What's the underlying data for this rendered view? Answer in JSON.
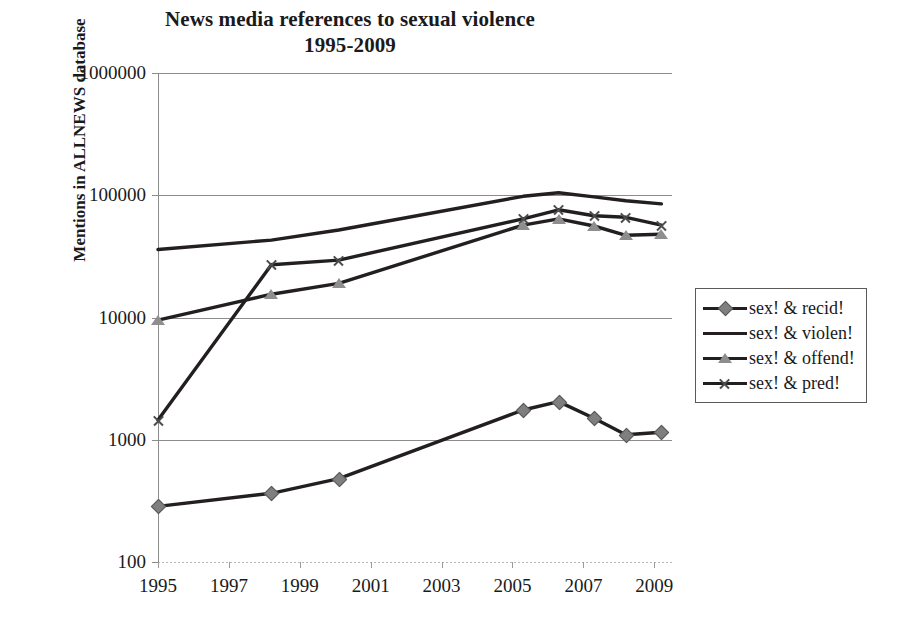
{
  "chart_data": {
    "type": "line",
    "title": "News media references to sexual violence\n1995-2009",
    "title_line1": "News media references to sexual violence",
    "title_line2": "1995-2009",
    "xlabel": "",
    "ylabel": "Mentions in ALLNEWS database",
    "yscale": "log",
    "ylim": [
      100,
      1000000
    ],
    "ytick_labels": [
      "1000000",
      "100000",
      "10000",
      "1000",
      "100"
    ],
    "ytick_values": [
      1000000,
      100000,
      10000,
      1000,
      100
    ],
    "xlim": [
      1995,
      2009.5
    ],
    "xtick_labels": [
      "1995",
      "1997",
      "1999",
      "2001",
      "2003",
      "2005",
      "2007",
      "2009"
    ],
    "xtick_values": [
      1995,
      1997,
      1999,
      2001,
      2003,
      2005,
      2007,
      2009
    ],
    "grid": "horizontal",
    "legend_position": "right-outside",
    "x": [
      1995,
      1998.2,
      2000.1,
      2005.3,
      2006.3,
      2007.3,
      2008.2,
      2009.2
    ],
    "series": [
      {
        "name": "sex! & recid!",
        "marker": "diamond",
        "color": "#231f20",
        "marker_color": "#7f7f7f",
        "values": [
          285,
          365,
          480,
          1750,
          2050,
          1500,
          1100,
          1150
        ]
      },
      {
        "name": "sex! & violen!",
        "marker": "none",
        "color": "#231f20",
        "marker_color": "#231f20",
        "values": [
          36000,
          43000,
          52000,
          98000,
          105000,
          97000,
          90000,
          85000
        ]
      },
      {
        "name": "sex! & offend!",
        "marker": "triangle",
        "color": "#231f20",
        "marker_color": "#8e8e8e",
        "values": [
          9500,
          15500,
          19000,
          57000,
          64000,
          56000,
          47000,
          48000
        ]
      },
      {
        "name": "sex! & pred!",
        "marker": "x",
        "color": "#231f20",
        "marker_color": "#4d4d4d",
        "values": [
          1450,
          27000,
          29500,
          64000,
          76000,
          68000,
          66000,
          57000
        ]
      }
    ]
  },
  "legend": {
    "entries": [
      {
        "label": "sex! & recid!",
        "marker": "diamond"
      },
      {
        "label": "sex! & violen!",
        "marker": "none"
      },
      {
        "label": "sex! & offend!",
        "marker": "triangle"
      },
      {
        "label": "sex! & pred!",
        "marker": "x"
      }
    ]
  },
  "colors": {
    "line": "#231f20",
    "grid": "#8c8c8c",
    "marker_grey": "#7f7f7f",
    "text": "#1a1a1a"
  }
}
